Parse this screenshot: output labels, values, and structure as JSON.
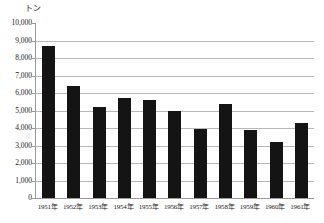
{
  "chart_data": {
    "type": "bar",
    "title": "",
    "subtitle": "",
    "xlabel": "",
    "ylabel": "トン",
    "unit_label": "トン",
    "categories": [
      "1951年",
      "1952年",
      "1953年",
      "1954年",
      "1955年",
      "1956年",
      "1957年",
      "1958年",
      "1959年",
      "1960年",
      "1961年"
    ],
    "values": [
      8700,
      6400,
      5200,
      5700,
      5600,
      5000,
      3950,
      5400,
      3900,
      3200,
      4300
    ],
    "ylim": [
      0,
      10000
    ],
    "ytick_step": 1000,
    "ytick_labels": [
      "10,000",
      "9,000",
      "8,000",
      "7,000",
      "6,000",
      "5,000",
      "4,000",
      "3,000",
      "2,000",
      "1,000",
      "0"
    ],
    "ytick_values": [
      10000,
      9000,
      8000,
      7000,
      6000,
      5000,
      4000,
      3000,
      2000,
      1000,
      0
    ],
    "grid": true,
    "legend": false,
    "legend_position": "none",
    "bar_color": "#141414",
    "grid_color": "#b8b8b8",
    "axis_color": "#9a9a9a",
    "background_color": "#ffffff"
  }
}
